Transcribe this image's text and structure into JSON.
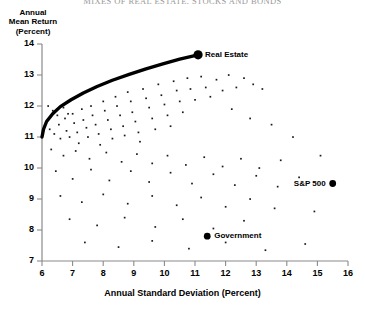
{
  "chart_data": {
    "type": "scatter",
    "title": "MIXES OF REAL ESTATE, STOCKS AND BONDS",
    "xlabel": "Annual Standard Deviation (Percent)",
    "ylabel_lines": [
      "Annual",
      "Mean Return",
      "(Percent)"
    ],
    "xlim": [
      6,
      16
    ],
    "ylim": [
      7,
      14
    ],
    "xticks": [
      6,
      7,
      8,
      9,
      10,
      11,
      12,
      13,
      14,
      15,
      16
    ],
    "yticks": [
      7,
      8,
      9,
      10,
      11,
      12,
      13,
      14
    ],
    "grid": false,
    "legend": "none",
    "frontier": {
      "name": "Efficient frontier",
      "x": [
        6.0,
        6.05,
        6.15,
        6.35,
        6.6,
        6.95,
        7.35,
        7.8,
        8.3,
        8.85,
        9.4,
        9.95,
        10.5,
        11.1
      ],
      "y": [
        11.0,
        11.25,
        11.5,
        11.75,
        11.98,
        12.2,
        12.42,
        12.63,
        12.83,
        13.02,
        13.2,
        13.36,
        13.51,
        13.65
      ]
    },
    "labeled_points": [
      {
        "name": "Real Estate",
        "x": 11.1,
        "y": 13.65,
        "label_side": "right"
      },
      {
        "name": "S&P 500",
        "x": 15.5,
        "y": 9.5,
        "label_side": "left"
      },
      {
        "name": "Government",
        "x": 11.4,
        "y": 7.8,
        "label_side": "right"
      }
    ],
    "scatter": {
      "name": "Portfolio mixes",
      "points": [
        [
          6.25,
          11.25
        ],
        [
          6.4,
          11.1
        ],
        [
          6.55,
          11.4
        ],
        [
          6.6,
          10.95
        ],
        [
          6.75,
          11.6
        ],
        [
          6.8,
          11.2
        ],
        [
          6.9,
          11.0
        ],
        [
          7.0,
          11.75
        ],
        [
          7.05,
          11.45
        ],
        [
          7.15,
          11.15
        ],
        [
          7.2,
          10.8
        ],
        [
          7.3,
          11.9
        ],
        [
          7.35,
          11.55
        ],
        [
          7.45,
          11.3
        ],
        [
          7.5,
          11.0
        ],
        [
          7.6,
          12.0
        ],
        [
          7.65,
          11.7
        ],
        [
          7.75,
          11.4
        ],
        [
          7.85,
          11.1
        ],
        [
          7.9,
          10.75
        ],
        [
          8.0,
          12.15
        ],
        [
          8.05,
          11.85
        ],
        [
          8.15,
          11.55
        ],
        [
          8.25,
          11.25
        ],
        [
          8.3,
          10.95
        ],
        [
          8.4,
          12.3
        ],
        [
          8.45,
          12.0
        ],
        [
          8.55,
          11.7
        ],
        [
          8.65,
          11.35
        ],
        [
          8.7,
          11.05
        ],
        [
          8.8,
          12.45
        ],
        [
          8.9,
          12.15
        ],
        [
          8.95,
          11.8
        ],
        [
          9.05,
          11.5
        ],
        [
          9.15,
          11.15
        ],
        [
          9.2,
          10.85
        ],
        [
          9.3,
          12.55
        ],
        [
          9.4,
          12.25
        ],
        [
          9.5,
          11.95
        ],
        [
          9.6,
          11.6
        ],
        [
          9.7,
          11.25
        ],
        [
          9.8,
          12.7
        ],
        [
          9.9,
          12.35
        ],
        [
          10.0,
          12.05
        ],
        [
          10.1,
          11.7
        ],
        [
          10.2,
          11.35
        ],
        [
          10.3,
          12.8
        ],
        [
          10.4,
          12.5
        ],
        [
          10.5,
          12.15
        ],
        [
          10.6,
          11.8
        ],
        [
          10.75,
          12.9
        ],
        [
          10.85,
          12.55
        ],
        [
          11.0,
          12.2
        ],
        [
          11.2,
          12.95
        ],
        [
          11.35,
          12.6
        ],
        [
          11.5,
          12.3
        ],
        [
          11.7,
          12.85
        ],
        [
          11.9,
          12.5
        ],
        [
          12.1,
          13.0
        ],
        [
          12.35,
          12.6
        ],
        [
          12.6,
          12.9
        ],
        [
          12.9,
          12.7
        ],
        [
          13.2,
          12.55
        ],
        [
          6.3,
          10.6
        ],
        [
          6.7,
          10.4
        ],
        [
          7.1,
          10.55
        ],
        [
          7.55,
          10.3
        ],
        [
          8.1,
          10.5
        ],
        [
          8.6,
          10.2
        ],
        [
          9.1,
          10.45
        ],
        [
          9.6,
          10.15
        ],
        [
          10.1,
          10.4
        ],
        [
          10.7,
          10.1
        ],
        [
          11.3,
          10.35
        ],
        [
          11.9,
          10.05
        ],
        [
          12.5,
          10.3
        ],
        [
          13.1,
          10.0
        ],
        [
          13.8,
          10.25
        ],
        [
          6.45,
          9.9
        ],
        [
          7.0,
          9.65
        ],
        [
          7.6,
          9.95
        ],
        [
          8.2,
          9.6
        ],
        [
          8.9,
          9.9
        ],
        [
          9.5,
          9.55
        ],
        [
          10.2,
          9.85
        ],
        [
          10.9,
          9.5
        ],
        [
          11.6,
          9.8
        ],
        [
          12.3,
          9.45
        ],
        [
          13.0,
          9.75
        ],
        [
          13.7,
          9.4
        ],
        [
          14.4,
          9.7
        ],
        [
          6.6,
          9.1
        ],
        [
          7.3,
          8.9
        ],
        [
          8.0,
          9.15
        ],
        [
          8.8,
          8.85
        ],
        [
          9.6,
          9.1
        ],
        [
          10.4,
          8.8
        ],
        [
          11.2,
          9.05
        ],
        [
          12.0,
          8.75
        ],
        [
          12.8,
          9.0
        ],
        [
          13.6,
          8.7
        ],
        [
          6.9,
          8.35
        ],
        [
          7.8,
          8.15
        ],
        [
          8.7,
          8.4
        ],
        [
          9.7,
          8.1
        ],
        [
          10.6,
          8.35
        ],
        [
          11.6,
          8.05
        ],
        [
          12.6,
          8.3
        ],
        [
          7.4,
          7.6
        ],
        [
          8.5,
          7.45
        ],
        [
          9.6,
          7.65
        ],
        [
          10.8,
          7.4
        ],
        [
          12.0,
          7.6
        ],
        [
          13.3,
          7.35
        ],
        [
          14.6,
          7.55
        ],
        [
          14.9,
          8.6
        ],
        [
          15.1,
          10.4
        ],
        [
          14.2,
          11.0
        ],
        [
          13.5,
          11.4
        ],
        [
          12.8,
          11.6
        ],
        [
          12.2,
          11.9
        ],
        [
          6.2,
          12.0
        ],
        [
          6.35,
          11.85
        ],
        [
          6.5,
          11.7
        ],
        [
          6.7,
          11.95
        ],
        [
          6.85,
          11.75
        ]
      ]
    }
  },
  "axis_extras": {
    "frontier_start_label": "11"
  }
}
